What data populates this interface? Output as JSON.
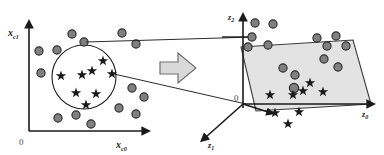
{
  "figure": {
    "title": "",
    "type": "diagram",
    "colors": {
      "stroke": "#1a1a1a",
      "dot_fill": "#808080",
      "dot_stroke": "#2b2b2b",
      "star_fill": "#1a1a1a",
      "plane_fill": "#e3e3e3",
      "plane_stroke": "#3a3a3a",
      "arrow_fill": "#d9d9d9",
      "arrow_stroke": "#6e6e6e",
      "background": "#ffffff",
      "origin_text": "#4a4a4a"
    }
  },
  "left_panel": {
    "name": "input-space-plot",
    "y_axis_label": {
      "base": "x",
      "sub": "c1"
    },
    "x_axis_label": {
      "base": "x",
      "sub": "c0"
    },
    "origin_label": "0",
    "axis": {
      "ox": 29,
      "oy": 131,
      "top_y": 24,
      "right_x": 146
    },
    "cluster_circle": {
      "cx": 84,
      "cy": 77,
      "r": 32
    },
    "dots": [
      {
        "x": 72,
        "y": 34
      },
      {
        "x": 84,
        "y": 42
      },
      {
        "x": 122,
        "y": 33
      },
      {
        "x": 136,
        "y": 44
      },
      {
        "x": 39,
        "y": 51
      },
      {
        "x": 57,
        "y": 50
      },
      {
        "x": 41,
        "y": 73
      },
      {
        "x": 132,
        "y": 88
      },
      {
        "x": 144,
        "y": 97
      },
      {
        "x": 119,
        "y": 108
      },
      {
        "x": 76,
        "y": 115
      },
      {
        "x": 58,
        "y": 118
      },
      {
        "x": 91,
        "y": 124
      },
      {
        "x": 136,
        "y": 114
      }
    ],
    "stars": [
      {
        "x": 61,
        "y": 76
      },
      {
        "x": 82,
        "y": 75
      },
      {
        "x": 92,
        "y": 71
      },
      {
        "x": 103,
        "y": 61
      },
      {
        "x": 112,
        "y": 74
      },
      {
        "x": 76,
        "y": 93
      },
      {
        "x": 96,
        "y": 94
      },
      {
        "x": 86,
        "y": 105
      }
    ]
  },
  "transform_arrow": {
    "name": "transform-arrow",
    "label": ""
  },
  "right_panel": {
    "name": "feature-space-plot",
    "z2_label": {
      "base": "z",
      "sub": "2"
    },
    "z1_label": {
      "base": "z",
      "sub": "1"
    },
    "z0_label": {
      "base": "z",
      "sub": "0"
    },
    "origin_label": "0",
    "origin": {
      "x": 243,
      "y": 104
    },
    "plane_polygon": "241,47 353,40 371,104 256,111",
    "dots": [
      {
        "x": 255,
        "y": 23
      },
      {
        "x": 273,
        "y": 24
      },
      {
        "x": 252,
        "y": 37
      },
      {
        "x": 248,
        "y": 47
      },
      {
        "x": 268,
        "y": 45
      },
      {
        "x": 317,
        "y": 38
      },
      {
        "x": 336,
        "y": 36
      },
      {
        "x": 327,
        "y": 46
      },
      {
        "x": 346,
        "y": 46
      },
      {
        "x": 324,
        "y": 59
      },
      {
        "x": 283,
        "y": 68
      },
      {
        "x": 338,
        "y": 67
      },
      {
        "x": 295,
        "y": 75
      },
      {
        "x": 294,
        "y": 88
      }
    ],
    "stars": [
      {
        "x": 310,
        "y": 83
      },
      {
        "x": 270,
        "y": 95
      },
      {
        "x": 293,
        "y": 95
      },
      {
        "x": 303,
        "y": 91
      },
      {
        "x": 323,
        "y": 92
      },
      {
        "x": 275,
        "y": 113
      },
      {
        "x": 299,
        "y": 112
      },
      {
        "x": 288,
        "y": 124
      }
    ]
  },
  "connectors": [
    {
      "name": "upper-connector",
      "from": "left-dot",
      "x1": 84,
      "y1": 42,
      "x2": 253,
      "y2": 37
    },
    {
      "name": "lower-connector",
      "from": "left-star",
      "x1": 112,
      "y1": 74,
      "x2": 244,
      "y2": 104
    }
  ]
}
